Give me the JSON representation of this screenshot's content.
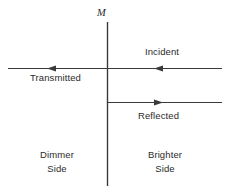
{
  "diagram": {
    "title_symbol": "M",
    "stroke_color": "#3a3a3a",
    "text_color": "#2b2b2b",
    "background_color": "#ffffff",
    "labels": {
      "incident": "Incident",
      "transmitted": "Transmitted",
      "reflected": "Reflected",
      "dimmer_side_line1": "Dimmer",
      "dimmer_side_line2": "Side",
      "brighter_side_line1": "Brighter",
      "brighter_side_line2": "Side"
    },
    "elements": {
      "interface_line_name": "mirror-interface-line",
      "incident_ray_name": "incident-ray",
      "transmitted_ray_name": "transmitted-ray",
      "reflected_ray_name": "reflected-ray"
    }
  }
}
